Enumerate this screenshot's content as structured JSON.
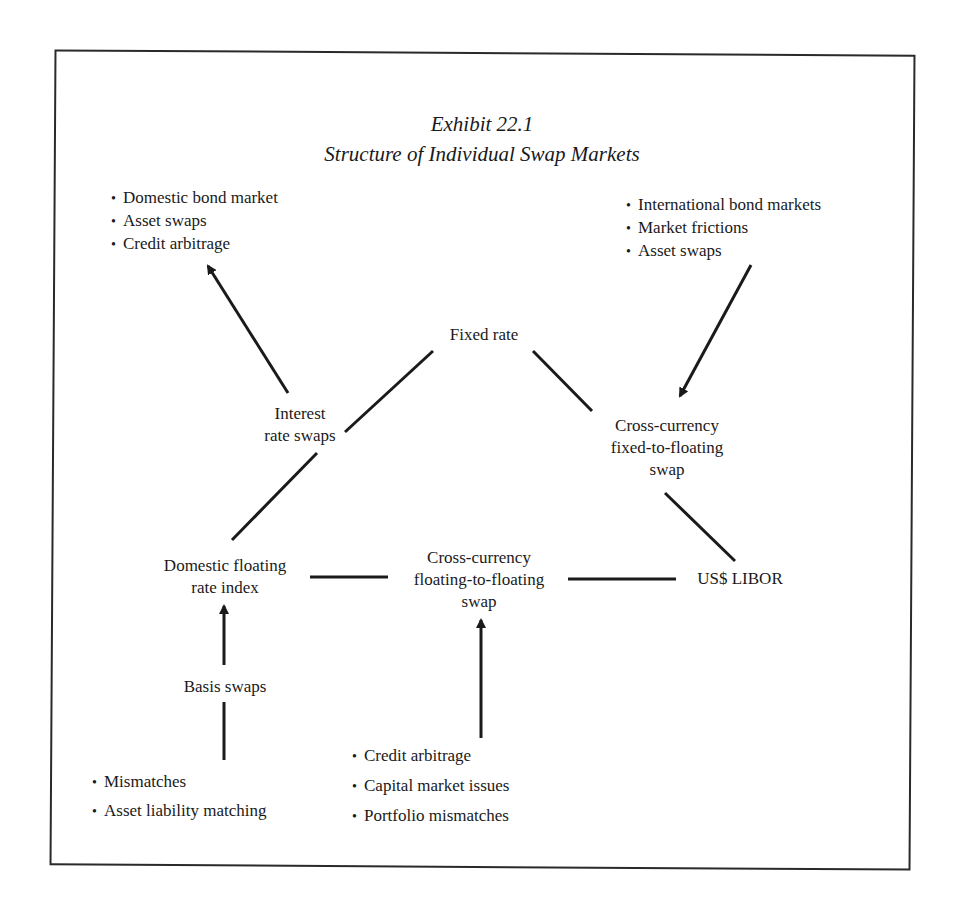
{
  "exhibit": {
    "number": "Exhibit 22.1",
    "title": "Structure of Individual Swap Markets"
  },
  "nodes": {
    "fixed_rate": "Fixed rate",
    "interest_rate_swaps": [
      "Interest",
      "rate swaps"
    ],
    "cross_fixed_floating": [
      "Cross-currency",
      "fixed-to-floating",
      "swap"
    ],
    "domestic_floating": [
      "Domestic floating",
      "rate index"
    ],
    "cross_floating_floating": [
      "Cross-currency",
      "floating-to-floating",
      "swap"
    ],
    "us_libor": "US$ LIBOR",
    "basis_swaps": "Basis swaps"
  },
  "bullets": {
    "top_left": [
      "Domestic bond market",
      "Asset swaps",
      "Credit arbitrage"
    ],
    "top_right": [
      "International bond markets",
      "Market frictions",
      "Asset swaps"
    ],
    "bottom_left": [
      "Mismatches",
      "Asset liability matching"
    ],
    "bottom_center": [
      "Credit arbitrage",
      "Capital market issues",
      "Portfolio mismatches"
    ]
  }
}
